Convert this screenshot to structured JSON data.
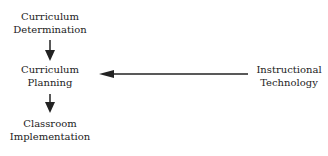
{
  "nodes": {
    "curriculum_determination": [
      "Curriculum",
      "Determination"
    ],
    "curriculum_planning": [
      "Curriculum",
      "Planning"
    ],
    "classroom_implementation": [
      "Classroom",
      "Implementation"
    ],
    "instructional_technology": [
      "Instructional",
      "Technology"
    ]
  },
  "edges": [
    {
      "from": "Curriculum Determination",
      "to": "Curriculum Planning"
    },
    {
      "from": "Curriculum Planning",
      "to": "Classroom Implementation"
    },
    {
      "from": "Instructional Technology",
      "to": "Curriculum Planning"
    }
  ]
}
